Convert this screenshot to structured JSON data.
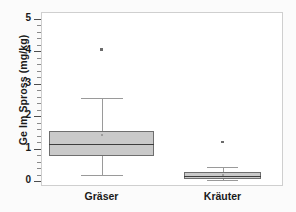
{
  "chart_data": {
    "type": "box",
    "title": "",
    "xlabel": "",
    "ylabel": "Ge Im Spross (mg/kg)",
    "ylim": [
      -0.15,
      5.2
    ],
    "yticks": [
      0,
      1,
      2,
      3,
      4,
      5
    ],
    "ytick_labels": [
      "0",
      "1",
      "2",
      "3",
      "4",
      "5"
    ],
    "minor_ticks": true,
    "grid": false,
    "legend": "none",
    "categories": [
      "Gräser",
      "Kräuter"
    ],
    "boxes": [
      {
        "name": "Gräser",
        "whisker_low": 0.2,
        "q1": 0.78,
        "median": 1.15,
        "mean": 1.42,
        "q3": 1.55,
        "whisker_high": 2.55,
        "outliers": [
          4.05
        ]
      },
      {
        "name": "Kräuter",
        "whisker_low": 0.02,
        "q1": 0.05,
        "median": 0.15,
        "mean": 0.2,
        "q3": 0.27,
        "whisker_high": 0.42,
        "outliers": [
          1.2
        ]
      }
    ],
    "colors": {
      "box_fill": "#c9c9c9",
      "box_edge": "#6e6e6e",
      "median": "#3d3d3d",
      "whisker": "#9a9a9a",
      "outlier": "#6b6b6b",
      "frame": "#cfcfcf",
      "text": "#1a1a1a",
      "background": "#ffffff"
    }
  }
}
